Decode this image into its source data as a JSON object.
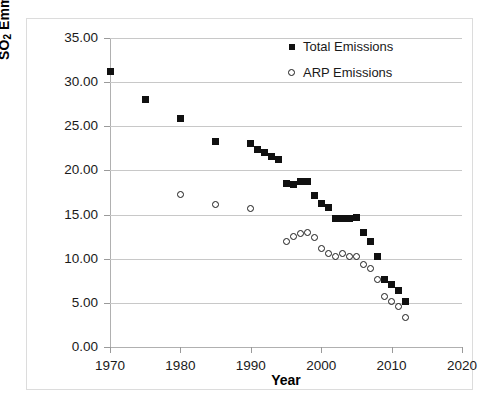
{
  "chart_data": {
    "type": "scatter",
    "title": "",
    "xlabel": "Year",
    "ylabel": "SO2 Emmisions 10^6 ton/yr",
    "ylabel_parts": {
      "prefix": "SO",
      "sub": "2",
      "middle": " Emmisions 10",
      "sup": "6",
      "suffix": "ton/yr"
    },
    "xlim": [
      1970,
      2020
    ],
    "ylim": [
      0,
      35
    ],
    "xticks": [
      1970,
      1980,
      1990,
      2000,
      2010,
      2020
    ],
    "xtick_labels": [
      "1970",
      "1980",
      "1990",
      "2000",
      "2010",
      "2020"
    ],
    "yticks": [
      0,
      5,
      10,
      15,
      20,
      25,
      30,
      35
    ],
    "ytick_labels": [
      "0.00",
      "5.00",
      "10.00",
      "15.00",
      "20.00",
      "25.00",
      "30.00",
      "35.00"
    ],
    "grid": "horizontal",
    "legend_position": "top-right",
    "marker_color": "#111111",
    "grid_color": "#c8c8c8",
    "series": [
      {
        "name": "Total Emissions",
        "marker": "filled-square",
        "points": [
          {
            "x": 1970,
            "y": 31.2
          },
          {
            "x": 1975,
            "y": 28.0
          },
          {
            "x": 1980,
            "y": 25.9
          },
          {
            "x": 1985,
            "y": 23.3
          },
          {
            "x": 1990,
            "y": 23.0
          },
          {
            "x": 1991,
            "y": 22.4
          },
          {
            "x": 1992,
            "y": 22.0
          },
          {
            "x": 1993,
            "y": 21.6
          },
          {
            "x": 1994,
            "y": 21.2
          },
          {
            "x": 1995,
            "y": 18.5
          },
          {
            "x": 1996,
            "y": 18.4
          },
          {
            "x": 1997,
            "y": 18.8
          },
          {
            "x": 1998,
            "y": 18.8
          },
          {
            "x": 1999,
            "y": 17.2
          },
          {
            "x": 2000,
            "y": 16.3
          },
          {
            "x": 2001,
            "y": 15.8
          },
          {
            "x": 2002,
            "y": 14.6
          },
          {
            "x": 2003,
            "y": 14.6
          },
          {
            "x": 2004,
            "y": 14.6
          },
          {
            "x": 2005,
            "y": 14.7
          },
          {
            "x": 2006,
            "y": 13.0
          },
          {
            "x": 2007,
            "y": 12.0
          },
          {
            "x": 2008,
            "y": 10.2
          },
          {
            "x": 2009,
            "y": 7.6
          },
          {
            "x": 2010,
            "y": 7.1
          },
          {
            "x": 2011,
            "y": 6.4
          },
          {
            "x": 2012,
            "y": 5.2
          }
        ]
      },
      {
        "name": "ARP Emissions",
        "marker": "open-circle",
        "points": [
          {
            "x": 1980,
            "y": 17.3
          },
          {
            "x": 1985,
            "y": 16.1
          },
          {
            "x": 1990,
            "y": 15.7
          },
          {
            "x": 1995,
            "y": 11.9
          },
          {
            "x": 1996,
            "y": 12.5
          },
          {
            "x": 1997,
            "y": 12.9
          },
          {
            "x": 1998,
            "y": 13.0
          },
          {
            "x": 1999,
            "y": 12.4
          },
          {
            "x": 2000,
            "y": 11.2
          },
          {
            "x": 2001,
            "y": 10.6
          },
          {
            "x": 2002,
            "y": 10.2
          },
          {
            "x": 2003,
            "y": 10.6
          },
          {
            "x": 2004,
            "y": 10.3
          },
          {
            "x": 2005,
            "y": 10.2
          },
          {
            "x": 2006,
            "y": 9.4
          },
          {
            "x": 2007,
            "y": 8.9
          },
          {
            "x": 2008,
            "y": 7.6
          },
          {
            "x": 2009,
            "y": 5.7
          },
          {
            "x": 2010,
            "y": 5.1
          },
          {
            "x": 2011,
            "y": 4.6
          },
          {
            "x": 2012,
            "y": 3.3
          }
        ]
      }
    ]
  },
  "legend": {
    "items": [
      {
        "label": "Total Emissions",
        "marker": "filled-square"
      },
      {
        "label": "ARP Emissions",
        "marker": "open-circle"
      }
    ]
  }
}
